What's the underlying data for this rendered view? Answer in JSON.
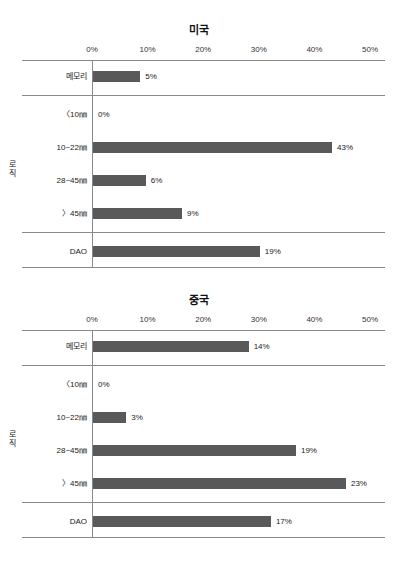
{
  "figure": {
    "bar_color": "#595959",
    "axis_color": "#8a8a8a",
    "background": "#ffffff"
  },
  "chart_data": [
    {
      "type": "bar",
      "orientation": "horizontal",
      "title": "미국",
      "xlabel": "",
      "ylabel": "",
      "xlim": [
        0,
        50
      ],
      "xticks": [
        "0%",
        "10%",
        "20%",
        "30%",
        "40%",
        "50%"
      ],
      "grid": false,
      "legend": "none",
      "group_label": "로직",
      "categories": [
        "메모리",
        "〈10㎚",
        "10~22㎚",
        "28~45㎚",
        "〉45㎚",
        "DAO"
      ],
      "values": [
        5,
        0,
        43,
        6,
        9,
        19
      ],
      "data_labels": [
        "5%",
        "0%",
        "43%",
        "6%",
        "9%",
        "19%"
      ],
      "bar_pixel_pct": [
        8.5,
        0,
        43,
        9.5,
        16,
        30
      ]
    },
    {
      "type": "bar",
      "orientation": "horizontal",
      "title": "중국",
      "xlabel": "",
      "ylabel": "",
      "xlim": [
        0,
        50
      ],
      "xticks": [
        "0%",
        "10%",
        "20%",
        "30%",
        "40%",
        "50%"
      ],
      "grid": false,
      "legend": "none",
      "group_label": "로직",
      "categories": [
        "메모리",
        "〈10㎚",
        "10~22㎚",
        "28~45㎚",
        "〉45㎚",
        "DAO"
      ],
      "values": [
        14,
        0,
        3,
        19,
        23,
        17
      ],
      "data_labels": [
        "14%",
        "0%",
        "3%",
        "19%",
        "23%",
        "17%"
      ],
      "bar_pixel_pct": [
        28,
        0,
        6,
        36.5,
        45.5,
        32
      ]
    }
  ]
}
